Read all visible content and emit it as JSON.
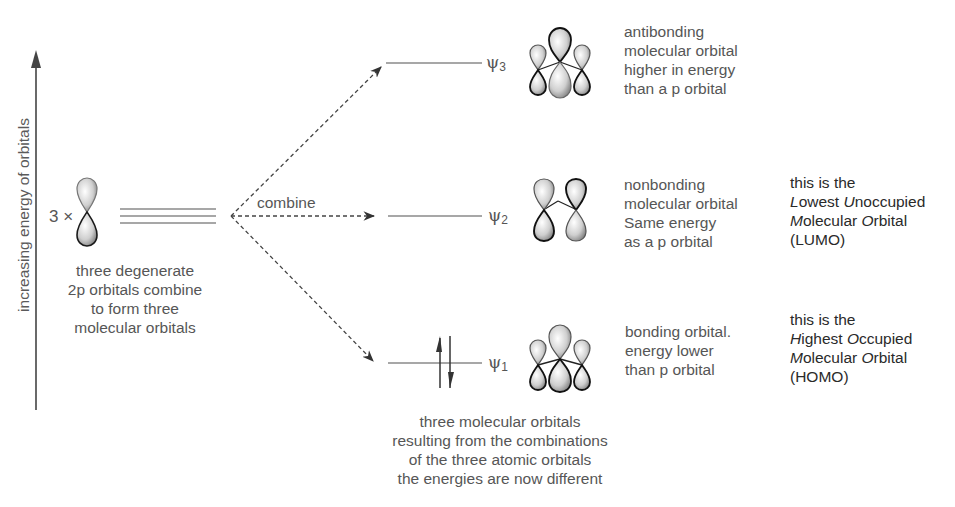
{
  "axis": {
    "label": "increasing energy of orbitals",
    "direction": "up"
  },
  "atomic_orbitals": {
    "multiplier": "3 ×",
    "count": 3,
    "caption": [
      "three degenerate",
      "2p orbitals combine",
      "to form three",
      "molecular orbitals"
    ]
  },
  "combine_label": "combine",
  "molecular_orbitals": [
    {
      "name": "ψ",
      "subscript": "3",
      "type": "antibonding",
      "description": [
        "antibonding",
        "molecular orbital",
        "higher in energy",
        "than a p orbital"
      ],
      "electrons": 0
    },
    {
      "name": "ψ",
      "subscript": "2",
      "type": "nonbonding",
      "description": [
        "nonbonding",
        "molecular orbital",
        "Same energy",
        "as a p orbital"
      ],
      "electrons": 0,
      "annotation": {
        "line1": "this is the",
        "line2": [
          {
            "t": "L",
            "i": true
          },
          {
            "t": "owest ",
            "i": false
          },
          {
            "t": "U",
            "i": true
          },
          {
            "t": "noccupied",
            "i": false
          }
        ],
        "line3": [
          {
            "t": "M",
            "i": true
          },
          {
            "t": "olecular ",
            "i": false
          },
          {
            "t": "O",
            "i": true
          },
          {
            "t": "rbital",
            "i": false
          }
        ],
        "line4": "(LUMO)"
      }
    },
    {
      "name": "ψ",
      "subscript": "1",
      "type": "bonding",
      "description": [
        "bonding orbital.",
        "energy lower",
        "than p orbital"
      ],
      "electrons": 2,
      "annotation": {
        "line1": "this is the",
        "line2": [
          {
            "t": "H",
            "i": true
          },
          {
            "t": "ighest ",
            "i": false
          },
          {
            "t": "O",
            "i": true
          },
          {
            "t": "ccupied",
            "i": false
          }
        ],
        "line3": [
          {
            "t": "M",
            "i": true
          },
          {
            "t": "olecular ",
            "i": false
          },
          {
            "t": "O",
            "i": true
          },
          {
            "t": "rbital",
            "i": false
          }
        ],
        "line4": "(HOMO)"
      }
    }
  ],
  "bottom_caption": [
    "three molecular orbitals",
    "resulting from the combinations",
    "of the three atomic orbitals",
    "the energies are now different"
  ],
  "colors": {
    "line": "#8a8a8a",
    "text": "#565656",
    "annotation_text": "#2a2a2a",
    "lobe_outline": "#1a1a1a"
  }
}
